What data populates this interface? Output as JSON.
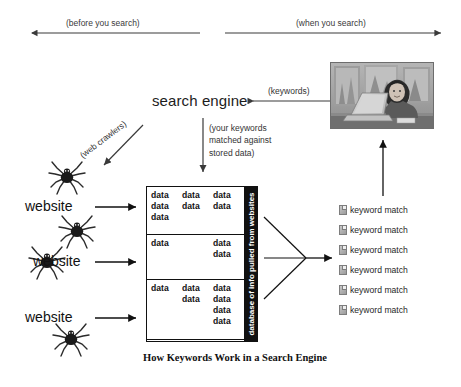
{
  "diagram": {
    "caption": "How Keywords Work in a Search Engine",
    "phases": {
      "left": "(before you search)",
      "right": "(when you search)"
    },
    "search_engine": {
      "title": "search engine",
      "keywords_arrow_label": "(keywords)",
      "matching_note_lines": [
        "(your keywords",
        "matched against",
        "stored data)"
      ]
    },
    "crawlers": {
      "label": "(web crawlers)"
    },
    "websites": [
      {
        "label": "website"
      },
      {
        "label": "website"
      },
      {
        "label": "website"
      }
    ],
    "spiders": [
      {
        "name": "spider-crawler-1"
      },
      {
        "name": "spider-crawler-2"
      },
      {
        "name": "spider-crawler-3"
      },
      {
        "name": "spider-crawler-4"
      }
    ],
    "database": {
      "spine_label": "database of info pulled from websites",
      "cell_text": "data",
      "rows": [
        {
          "lines": [
            [
              "data",
              "data",
              "data"
            ],
            [
              "data",
              "data",
              "data"
            ],
            [
              "data",
              "",
              ""
            ]
          ]
        },
        {
          "lines": [
            [
              "data",
              "",
              "data"
            ],
            [
              "",
              "",
              "data"
            ]
          ]
        },
        {
          "lines": [
            [
              "data",
              "data",
              "data"
            ],
            [
              "",
              "data",
              "data"
            ],
            [
              "",
              "",
              "data"
            ],
            [
              "",
              "",
              "data"
            ]
          ]
        }
      ]
    },
    "results": {
      "items": [
        {
          "label": "keyword match"
        },
        {
          "label": "keyword match"
        },
        {
          "label": "keyword match"
        },
        {
          "label": "keyword match"
        },
        {
          "label": "keyword match"
        },
        {
          "label": "keyword match"
        }
      ]
    },
    "photo": {
      "alt": "woman-using-laptop-photo"
    },
    "colors": {
      "ink": "#111111",
      "arrow": "#3a3a3a",
      "spine": "#111111",
      "background": "#ffffff"
    }
  }
}
